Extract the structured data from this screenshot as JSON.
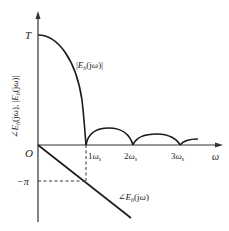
{
  "diagram": {
    "y_axis_label": "∠E_h(jω), |E_h(jω)|",
    "x_axis_label": "ω",
    "origin_label": "O",
    "amplitude_peak_label": "T",
    "neg_pi_label": "−π",
    "magnitude_curve_label": "|E_h(jω)|",
    "phase_curve_label": "∠E_h(jω)",
    "x_ticks": [
      {
        "label": "ω",
        "sub": "s",
        "prefix": "",
        "x": 86
      },
      {
        "label": "ω",
        "sub": "s",
        "prefix": "2",
        "x": 133
      },
      {
        "label": "ω",
        "sub": "s",
        "prefix": "3",
        "x": 180
      }
    ],
    "colors": {
      "line": "#1a1a1a",
      "axis": "#333333"
    }
  }
}
